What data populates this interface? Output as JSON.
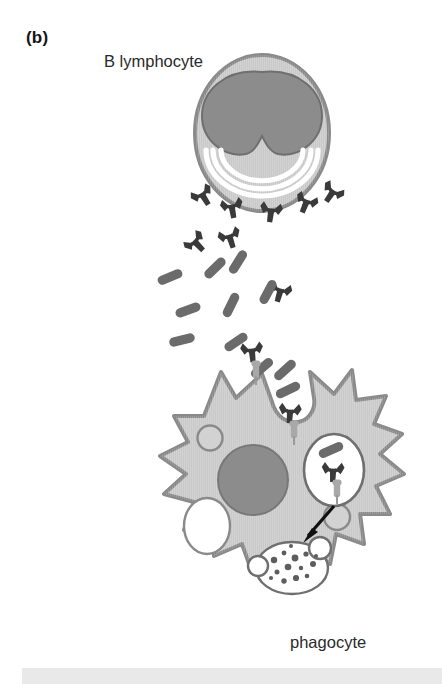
{
  "figure": {
    "panel_label": "(b)",
    "caption_top": "B lymphocyte",
    "caption_bottom": "phagocyte"
  },
  "labels": {
    "panel": "(b)",
    "b_lymphocyte": "B lymphocyte",
    "phagocyte": "phagocyte"
  },
  "colors": {
    "cytoplasm": "#c9c9c9",
    "cytoplasm_light": "#d2d2d2",
    "membrane_outline": "#8a8a8a",
    "nucleus": "#8c8c8c",
    "nucleus_outline": "#6f6f6f",
    "antibody": "#3a3a3a",
    "bacterium": "#6b6b6b",
    "receptor": "#a8a8a8",
    "vesicle_fill": "#ffffff",
    "arrow": "#111111",
    "text": "#2a2a2a",
    "bottom_bar": "#e9e9e9"
  },
  "structures": {
    "b_lymphocyte": {
      "name": "B lymphocyte",
      "nucleus": "kidney-shaped nucleus",
      "organelle": "rough endoplasmic reticulum arcs",
      "er_arc_count": 3,
      "secreted": "antibodies"
    },
    "antibodies": {
      "name": "antibody",
      "shape": "Y-shaped immunoglobulin",
      "count_free": 9,
      "count_bound": 4
    },
    "bacteria": {
      "name": "bacterium",
      "shape": "rod / bacillus",
      "count": 12
    },
    "phagocyte": {
      "name": "phagocyte",
      "nucleus": "round nucleus",
      "pseudopodia": 13,
      "receptors": "Fc receptors",
      "vacuole_count": 4,
      "phagosome_count": 2,
      "phagolysosome": "digestive vesicle with degraded particles"
    },
    "arrow": {
      "name": "maturation arrow",
      "meaning": "phagosome fuses and becomes phagolysosome"
    }
  }
}
